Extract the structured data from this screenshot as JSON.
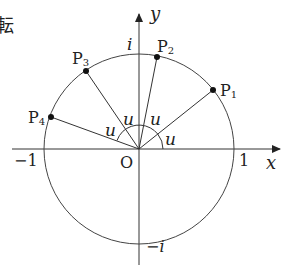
{
  "partial_text": "転",
  "axes": {
    "x_label": "x",
    "y_label": "y"
  },
  "ticks": {
    "neg_one": "−1",
    "one": "1",
    "origin": "O",
    "i": "i",
    "neg_i": "−i"
  },
  "points": [
    {
      "label": "P",
      "sub": "1"
    },
    {
      "label": "P",
      "sub": "2"
    },
    {
      "label": "P",
      "sub": "3"
    },
    {
      "label": "P",
      "sub": "4"
    }
  ],
  "angle_label": "u",
  "colors": {
    "stroke": "#333333",
    "text": "#222222"
  }
}
